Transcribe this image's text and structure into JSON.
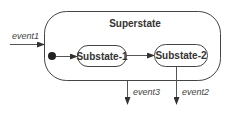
{
  "diagram": {
    "type": "UML state machine",
    "superstate": {
      "label": "Superstate"
    },
    "substates": [
      {
        "label": "Substate-1"
      },
      {
        "label": "Substate-2"
      }
    ],
    "initial_pseudostate": {
      "shape": "filled-circle"
    },
    "transitions": [
      {
        "label": "event1",
        "from": "outside",
        "to": "Superstate"
      },
      {
        "label": "",
        "from": "initial",
        "to": "Substate-1"
      },
      {
        "label": "",
        "from": "Substate-1",
        "to": "Substate-2"
      },
      {
        "label": "event3",
        "from": "Superstate",
        "to": "outside"
      },
      {
        "label": "event2",
        "from": "Substate-2",
        "to": "outside"
      }
    ],
    "colors": {
      "line": "#555555",
      "text": "#333333",
      "background": "#ffffff"
    }
  }
}
